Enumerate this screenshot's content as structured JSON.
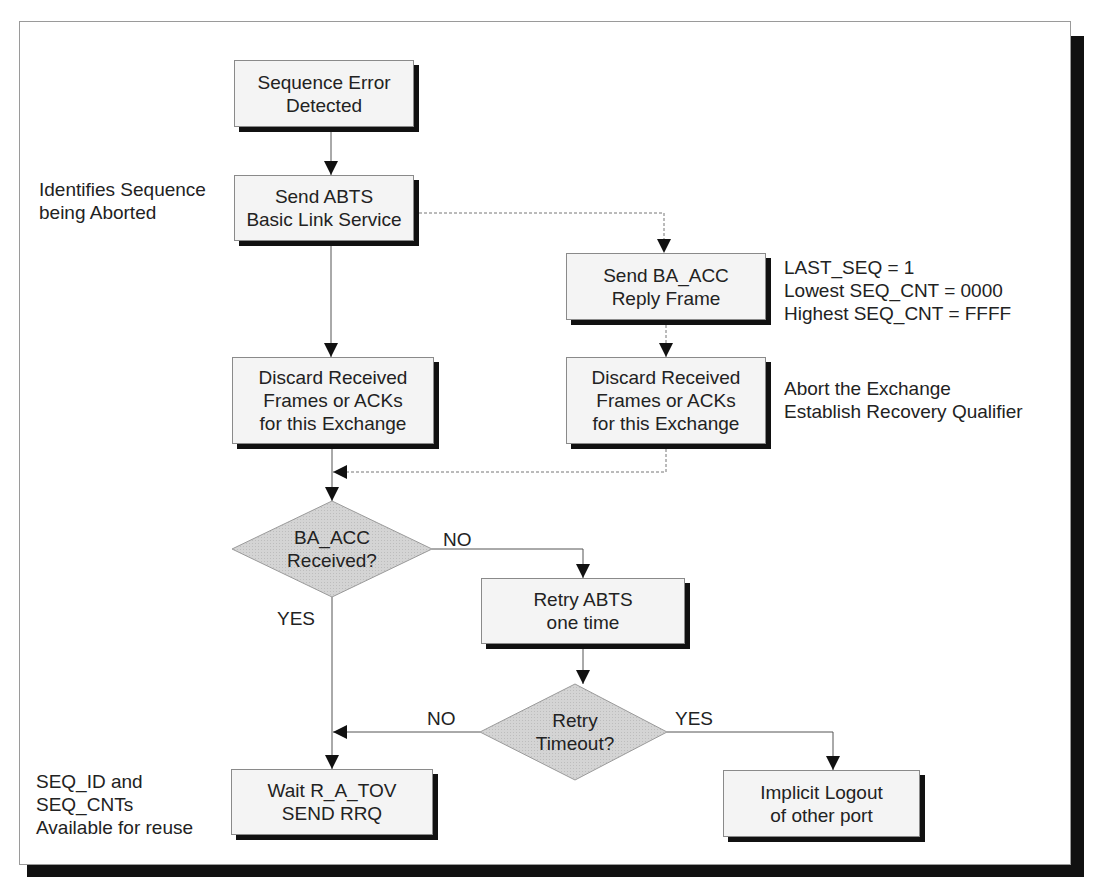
{
  "diagram": {
    "type": "flowchart",
    "colors": {
      "box_fill": "#f4f4f4",
      "box_border": "#8a8a8a",
      "shadow": "#111111",
      "decision_fill": "#d2d2d2",
      "line": "#555555"
    },
    "nodes": {
      "sequence_error": {
        "text": "Sequence Error\nDetected"
      },
      "send_abts": {
        "text": "Send ABTS\nBasic Link Service"
      },
      "send_ba_acc": {
        "text": "Send BA_ACC\nReply Frame"
      },
      "discard_left": {
        "text": "Discard Received\nFrames or ACKs\nfor this Exchange"
      },
      "discard_right": {
        "text": "Discard Received\nFrames or ACKs\nfor this Exchange"
      },
      "ba_acc_received": {
        "text": "BA_ACC\nReceived?"
      },
      "retry_abts": {
        "text": "Retry ABTS\none time"
      },
      "retry_timeout": {
        "text": "Retry\nTimeout?"
      },
      "wait_rrq": {
        "text": "Wait R_A_TOV\nSEND RRQ"
      },
      "implicit_logout": {
        "text": "Implicit Logout\nof other port"
      }
    },
    "notes": {
      "identifies": "Identifies Sequence\nbeing Aborted",
      "ba_acc_fields": "LAST_SEQ = 1\nLowest SEQ_CNT = 0000\nHighest SEQ_CNT = FFFF",
      "abort_exchange": "Abort the Exchange\nEstablish Recovery Qualifier",
      "seq_reuse": "SEQ_ID and\nSEQ_CNTs\nAvailable for reuse"
    },
    "edge_labels": {
      "ba_acc_no": "NO",
      "ba_acc_yes": "YES",
      "timeout_no": "NO",
      "timeout_yes": "YES"
    }
  }
}
